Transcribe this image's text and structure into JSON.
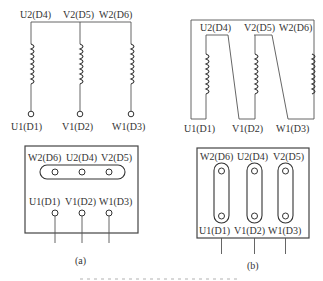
{
  "figure_a": {
    "top_labels": [
      "U2(D4)",
      "V2(D5)",
      "W2(D6)"
    ],
    "bottom_labels": [
      "U1(D1)",
      "V1(D2)",
      "W1(D3)"
    ],
    "terminal_box": {
      "top_row_labels": [
        "W2(D6)",
        "U2(D4)",
        "V2(D5)"
      ],
      "bottom_row_labels": [
        "U1(D1)",
        "V1(D2)",
        "W1(D3)"
      ]
    },
    "caption": "(a)",
    "connection": "star"
  },
  "figure_b": {
    "top_labels": [
      "U2(D4)",
      "V2(D5)",
      "W2(D6)"
    ],
    "bottom_labels": [
      "U1(D1)",
      "V1(D2)",
      "W1(D3)"
    ],
    "terminal_box": {
      "top_row_labels": [
        "W2(D6)",
        "U2(D4)",
        "V2(D5)"
      ],
      "bottom_row_labels": [
        "U1(D1)",
        "V1(D2)",
        "W1(D3)"
      ]
    },
    "caption": "(b)",
    "connection": "delta"
  },
  "colors": {
    "line": "#555555",
    "text": "#333333",
    "background": "#ffffff"
  }
}
